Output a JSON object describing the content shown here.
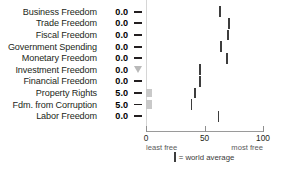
{
  "chart_data": {
    "type": "bar",
    "title": "",
    "xlabel": "",
    "ylabel": "",
    "xlim": [
      0,
      100
    ],
    "grid": false,
    "legend_position": "bottom",
    "categories": [
      "Business Freedom",
      "Trade Freedom",
      "Fiscal Freedom",
      "Government Spending",
      "Monetary Freedom",
      "Investment Freedom",
      "Financial Freedom",
      "Property Rights",
      "Fdm. from Corruption",
      "Labor Freedom"
    ],
    "values": [
      0.0,
      0.0,
      0.0,
      0.0,
      0.0,
      0.0,
      0.0,
      5.0,
      5.0,
      0.0
    ],
    "score_labels": [
      "0.0",
      "0.0",
      "0.0",
      "0.0",
      "0.0",
      "0.0",
      "0.0",
      "5.0",
      "5.0",
      "0.0"
    ],
    "change_markers": [
      "dash",
      "dash",
      "dash",
      "dash",
      "dash",
      "triangle-down",
      "dash",
      "dash",
      "dash",
      "dash"
    ],
    "series": [
      {
        "name": "country score",
        "values": [
          0.0,
          0.0,
          0.0,
          0.0,
          0.0,
          0.0,
          0.0,
          5.0,
          5.0,
          0.0
        ]
      },
      {
        "name": "world average",
        "values": [
          63,
          71,
          70,
          64,
          69,
          46,
          46,
          42,
          39,
          62
        ]
      }
    ],
    "tick_values": [
      0,
      50,
      100
    ],
    "tick_labels": [
      "0",
      "50",
      "100"
    ],
    "axis_end_labels": {
      "left": "least free",
      "right": "most free"
    },
    "legend": {
      "symbol": "|",
      "text": "= world average"
    },
    "colors": {
      "bar": "#c9c9c9",
      "world_average_tick": "#3d3d3d",
      "marker_dash": "#231f20",
      "marker_triangle": "#b9b9b9",
      "text": "#231f20",
      "axis": "#9a9a9a"
    }
  }
}
